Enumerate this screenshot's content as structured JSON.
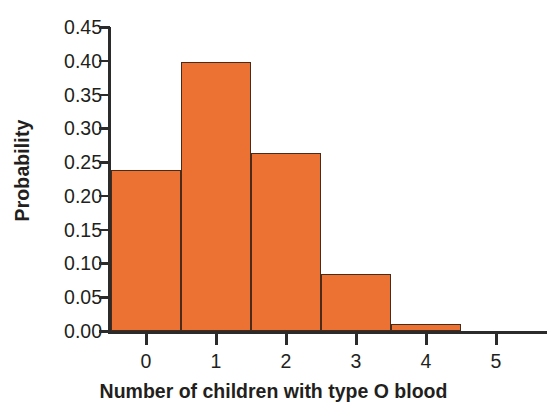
{
  "chart_data": {
    "type": "bar",
    "title": "",
    "subtitle": "",
    "xlabel": "Number of children with type O blood",
    "ylabel": "Probability",
    "categories": [
      "0",
      "1",
      "2",
      "3",
      "4",
      "5"
    ],
    "values": [
      0.238,
      0.398,
      0.264,
      0.084,
      0.011,
      0.0
    ],
    "series": [
      {
        "name": "Probability",
        "values": [
          0.238,
          0.398,
          0.264,
          0.084,
          0.011,
          0.0
        ]
      }
    ],
    "xlim": [
      -0.5,
      5.7
    ],
    "ylim": [
      0.0,
      0.45
    ],
    "ytick_labels": [
      "0.00",
      "0.05",
      "0.10",
      "0.15",
      "0.20",
      "0.25",
      "0.30",
      "0.35",
      "0.40",
      "0.45"
    ],
    "ytick_values": [
      0.0,
      0.05,
      0.1,
      0.15,
      0.2,
      0.25,
      0.3,
      0.35,
      0.4,
      0.45
    ],
    "xtick_labels": [
      "0",
      "1",
      "2",
      "3",
      "4",
      "5"
    ],
    "xtick_values": [
      0,
      1,
      2,
      3,
      4,
      5
    ],
    "grid": false,
    "legend": false,
    "legend_position": "none",
    "bar_fill_color": "#ec7233",
    "bar_edge_color": "#4a2a18",
    "axis_color": "#2b2b2b",
    "background_color": "#ffffff",
    "text_color": "#231f20",
    "bar_width": 1.0,
    "annotations": []
  }
}
